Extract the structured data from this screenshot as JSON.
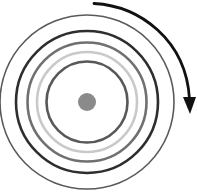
{
  "diagram": {
    "type": "concentric-circles-with-rotation-arrow",
    "center": {
      "x": 87,
      "y": 102
    },
    "rings": [
      {
        "name": "outer-ring",
        "radius": 87,
        "color": "#5a5a5a",
        "width": 1.6
      },
      {
        "name": "dark-ring",
        "radius": 71,
        "color": "#2e2e2e",
        "width": 2.6
      },
      {
        "name": "gray-ring",
        "radius": 59.5,
        "color": "#707070",
        "width": 2.6
      },
      {
        "name": "light-ring",
        "radius": 50,
        "color": "#c9c9c9",
        "width": 2.6
      },
      {
        "name": "inner-ring",
        "radius": 40.5,
        "color": "#585858",
        "width": 2.6
      }
    ],
    "center_dot": {
      "radius": 9,
      "color": "#8a8a8a"
    },
    "arrow": {
      "direction": "clockwise",
      "color": "#111111",
      "path": "M94,3.5 C140,6 186,40 189.5,99",
      "head": "183,97 196,97 190,114"
    }
  }
}
